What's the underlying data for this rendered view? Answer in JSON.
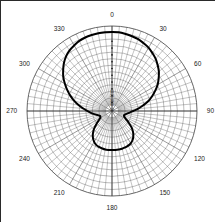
{
  "figure": {
    "title": "",
    "kind": "polar-radiation-pattern"
  },
  "chart_data": {
    "type": "line",
    "subtype": "polar",
    "title": "",
    "xlabel": "",
    "ylabel": "",
    "grid": true,
    "legend_position": "none",
    "angle_unit": "degrees",
    "angle_direction": "clockwise",
    "angle_zero_at": "top",
    "angle_tick_labels": [
      "0",
      "30",
      "60",
      "90",
      "120",
      "150",
      "180",
      "210",
      "240",
      "270",
      "300",
      "330"
    ],
    "angle_tick_values": [
      0,
      30,
      60,
      90,
      120,
      150,
      180,
      210,
      240,
      270,
      300,
      330
    ],
    "angle_minor_step_deg": 5,
    "radial_tick_labels": [
      "10",
      "20",
      "30",
      "40",
      "50"
    ],
    "radial_axis_note": "dB, outer ring = 0 dB, center = minimum",
    "radial_rings": 13,
    "rlim": [
      0,
      1
    ],
    "series": [
      {
        "name": "Radiation pattern",
        "color": "#000000",
        "line_width": 2,
        "angles_deg": [
          0,
          5,
          10,
          15,
          20,
          25,
          30,
          35,
          40,
          45,
          50,
          55,
          60,
          65,
          70,
          75,
          80,
          85,
          90,
          95,
          100,
          105,
          110,
          115,
          120,
          125,
          130,
          135,
          140,
          145,
          150,
          155,
          160,
          165,
          170,
          175,
          180,
          185,
          190,
          195,
          200,
          205,
          210,
          215,
          220,
          225,
          230,
          235,
          240,
          245,
          250,
          255,
          260,
          265,
          270,
          275,
          280,
          285,
          290,
          295,
          300,
          305,
          310,
          315,
          320,
          325,
          330,
          335,
          340,
          345,
          350,
          355
        ],
        "values": [
          0.93,
          0.93,
          0.92,
          0.91,
          0.9,
          0.88,
          0.86,
          0.83,
          0.8,
          0.76,
          0.72,
          0.67,
          0.62,
          0.56,
          0.5,
          0.44,
          0.37,
          0.31,
          0.25,
          0.21,
          0.18,
          0.16,
          0.15,
          0.16,
          0.19,
          0.24,
          0.3,
          0.35,
          0.39,
          0.42,
          0.44,
          0.45,
          0.455,
          0.46,
          0.46,
          0.46,
          0.46,
          0.46,
          0.46,
          0.455,
          0.45,
          0.44,
          0.42,
          0.39,
          0.35,
          0.3,
          0.24,
          0.19,
          0.16,
          0.15,
          0.16,
          0.18,
          0.21,
          0.25,
          0.29,
          0.34,
          0.4,
          0.46,
          0.52,
          0.58,
          0.64,
          0.7,
          0.75,
          0.8,
          0.84,
          0.87,
          0.89,
          0.91,
          0.92,
          0.925,
          0.93,
          0.93
        ]
      }
    ],
    "markers": {
      "name": "axis-tick-dots",
      "along_angle_deg": 0,
      "radii": [
        0.1,
        0.18,
        0.26,
        0.34,
        0.42,
        0.5,
        0.58,
        0.66,
        0.74,
        0.82
      ]
    }
  }
}
